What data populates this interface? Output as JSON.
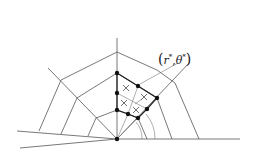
{
  "diagram": {
    "annotation_label": "(r*, θ*)",
    "label_parts": {
      "open": "(",
      "r": "r",
      "star1": "*",
      "comma": ",",
      "theta": "θ",
      "star2": "*",
      "close": ")"
    },
    "colors": {
      "line": "#555555",
      "bold": "#222222",
      "dot": "#111111",
      "background": "#ffffff"
    }
  }
}
